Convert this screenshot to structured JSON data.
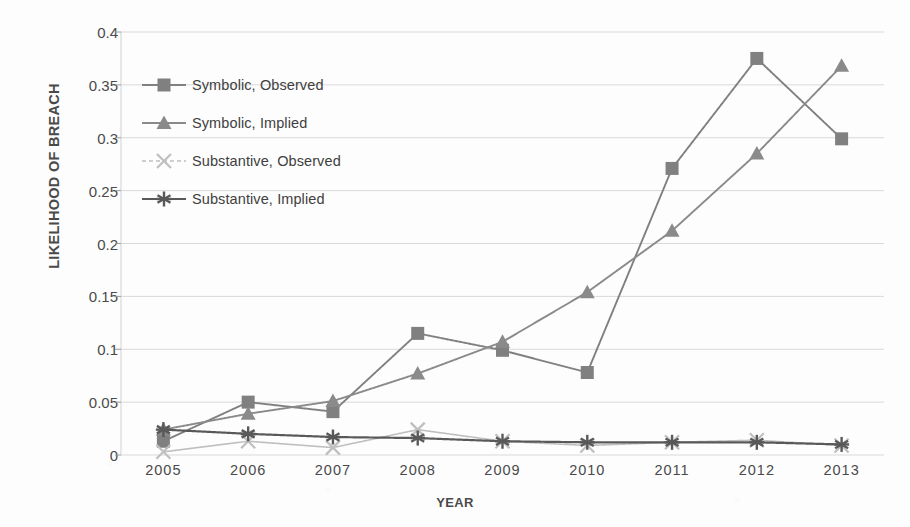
{
  "chart_data": {
    "type": "line",
    "title": "",
    "xlabel": "YEAR",
    "ylabel": "LIKELIHOOD OF BREACH",
    "categories": [
      "2005",
      "2006",
      "2007",
      "2008",
      "2009",
      "2010",
      "2011",
      "2012",
      "2013"
    ],
    "x": [
      2005,
      2006,
      2007,
      2008,
      2009,
      2010,
      2011,
      2012,
      2013
    ],
    "ylim": [
      0,
      0.4
    ],
    "yticks": [
      "0",
      "0.05",
      "0.1",
      "0.15",
      "0.2",
      "0.25",
      "0.3",
      "0.35",
      "0.4"
    ],
    "ytick_values": [
      0,
      0.05,
      0.1,
      0.15,
      0.2,
      0.25,
      0.3,
      0.35,
      0.4
    ],
    "grid": true,
    "legend_position": "upper-left-inside",
    "series": [
      {
        "name": "Symbolic, Observed",
        "marker": "square",
        "color": "#808080",
        "values": [
          0.013,
          0.05,
          0.041,
          0.115,
          0.099,
          0.078,
          0.271,
          0.375,
          0.299
        ]
      },
      {
        "name": "Symbolic, Implied",
        "marker": "triangle",
        "color": "#8a8a8a",
        "values": [
          0.024,
          0.039,
          0.051,
          0.077,
          0.107,
          0.154,
          0.212,
          0.285,
          0.368
        ]
      },
      {
        "name": "Substantive, Observed",
        "marker": "x",
        "color": "#bfbfbf",
        "values": [
          0.003,
          0.013,
          0.007,
          0.024,
          0.013,
          0.009,
          0.012,
          0.014,
          0.009
        ]
      },
      {
        "name": "Substantive, Implied",
        "marker": "asterisk",
        "color": "#595959",
        "values": [
          0.024,
          0.02,
          0.017,
          0.016,
          0.013,
          0.012,
          0.012,
          0.012,
          0.01
        ]
      }
    ]
  },
  "axis": {
    "y_title": "LIKELIHOOD OF BREACH",
    "x_title": "YEAR"
  },
  "legend": {
    "items": [
      {
        "label": "Symbolic, Observed",
        "marker": "square-marker",
        "color": "#808080"
      },
      {
        "label": "Symbolic, Implied",
        "marker": "triangle-marker",
        "color": "#8a8a8a"
      },
      {
        "label": "Substantive, Observed",
        "marker": "x-marker",
        "color": "#bfbfbf"
      },
      {
        "label": "Substantive, Implied",
        "marker": "asterisk-marker",
        "color": "#595959"
      }
    ]
  },
  "colors": {
    "plot_background": "#fdfdfd",
    "grid": "#d9d9d9",
    "axis_text": "#4a4a4a"
  }
}
